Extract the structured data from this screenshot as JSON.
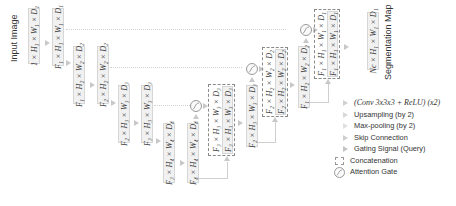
{
  "title_input": "Input Image",
  "title_output": "Segmentation Map",
  "boxes": [
    {
      "label": "1 × H₁ × W₁ × D₁"
    },
    {
      "label": "F₁ × H₁ × W₁ × D₁"
    },
    {
      "label": "F₁ × H₂ × W₂ × D₂"
    },
    {
      "label": "F₂ × H₂ × W₂ × D₂"
    },
    {
      "label": "F₂ × H₃ × W₃ × D₃"
    },
    {
      "label": "F₃ × H₃ × W₃ × D₃"
    },
    {
      "label": "F₃ × H₄ × W₄ × D₄"
    },
    {
      "label": "F₄ × H₄ × W₄ × D₄"
    },
    {
      "label": "F₃ × H₃ × W₃ × D₃"
    },
    {
      "label": "F₃ × H₃ × W₃ × D₃"
    },
    {
      "label": "F₂ × H₃ × W₃ × D₃"
    },
    {
      "label": "F₂ × H₂ × W₂ × D₂"
    },
    {
      "label": "F₂ × H₂ × W₂ × D₂"
    },
    {
      "label": "F₁ × H₂ × W₂ × D₂"
    },
    {
      "label": "F₁ × H₁ × W₁ × D₁"
    },
    {
      "label": "F₁ × H₁ × W₁ × D₁"
    },
    {
      "label": "Nc × H₁ × W₁ × D₁"
    }
  ],
  "legend": {
    "items": [
      {
        "icon": "arrow-conv",
        "label": "(Conv 3x3x3 + ReLU) (x2)"
      },
      {
        "icon": "arrow-upsampling",
        "label": "Upsampling (by 2)"
      },
      {
        "icon": "arrow-maxpool",
        "label": "Max-pooling (by 2)"
      },
      {
        "icon": "arrow-skip",
        "label": "Skip Connection"
      },
      {
        "icon": "arrow-gating",
        "label": "Gating Signal (Query)"
      },
      {
        "icon": "dashed-box",
        "label": "Concatenation"
      },
      {
        "icon": "attention-gate",
        "label": "Attention Gate"
      }
    ]
  },
  "colors": {
    "box_fill": "#f1f1f1",
    "box_border": "#d6d6d6",
    "arrow": "#c8c8c8",
    "text": "#333333"
  }
}
